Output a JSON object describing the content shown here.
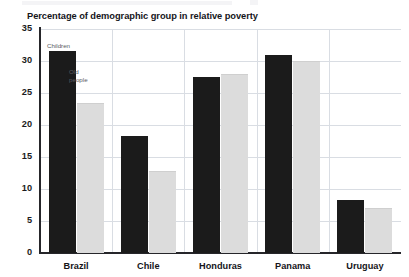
{
  "chart_title": "Percentage of demographic group in relative poverty",
  "annotations": {
    "children_label": "Children",
    "old_people_line1": "Old",
    "old_people_line2": "people"
  },
  "axis": {
    "y_ticks": [
      "35",
      "30",
      "25",
      "20",
      "15",
      "10",
      "5",
      "0"
    ],
    "x_ticks": [
      "Brazil",
      "Chile",
      "Honduras",
      "Panama",
      "Uruguay"
    ]
  },
  "colors": {
    "children_bar": "#1b1b1b",
    "old_people_bar": "#dcdcdc",
    "gridline": "#d9dde3",
    "axis": "#26262a",
    "text": "#15151a"
  },
  "chart_data": {
    "type": "bar",
    "title": "Percentage of demographic group in relative poverty",
    "xlabel": "",
    "ylabel": "",
    "ylim": [
      0,
      35
    ],
    "yticks": [
      0,
      5,
      10,
      15,
      20,
      25,
      30,
      35
    ],
    "grid": true,
    "legend": "inline annotations on first group",
    "categories": [
      "Brazil",
      "Chile",
      "Honduras",
      "Panama",
      "Uruguay"
    ],
    "series": [
      {
        "name": "Children",
        "color": "#1b1b1b",
        "values": [
          31.5,
          18.3,
          27.5,
          31.0,
          8.3
        ]
      },
      {
        "name": "Old people",
        "color": "#dcdcdc",
        "values": [
          23.5,
          12.8,
          28.0,
          30.0,
          7.0
        ]
      }
    ]
  }
}
